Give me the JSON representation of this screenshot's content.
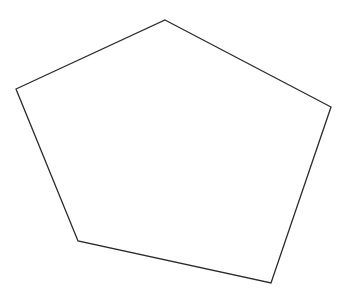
{
  "diagram": {
    "shape": "pentagon",
    "stroke_color": "#2b2b2b",
    "fill_color": "#ffffff",
    "background": "#ffffff",
    "vertices": [
      {
        "name": "top",
        "x": 165,
        "y": 20
      },
      {
        "name": "right",
        "x": 331,
        "y": 107
      },
      {
        "name": "bottom-right",
        "x": 271,
        "y": 283
      },
      {
        "name": "bottom-left",
        "x": 78,
        "y": 241
      },
      {
        "name": "left",
        "x": 16,
        "y": 89
      }
    ]
  }
}
